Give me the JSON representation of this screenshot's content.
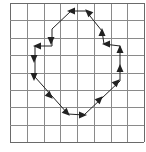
{
  "diagram": {
    "type": "chain-code-contour-on-grid",
    "grid": {
      "cols": 8,
      "rows": 8,
      "left": 10,
      "top": 3,
      "right": 144,
      "bottom": 142,
      "line_color": "#8a8a8a",
      "border_color": "#6a6a6a"
    },
    "contour": {
      "stroke_color": "#222222",
      "closed": true,
      "points": [
        [
          86,
          11
        ],
        [
          71,
          11
        ],
        [
          52,
          29
        ],
        [
          52,
          46
        ],
        [
          35,
          46
        ],
        [
          35,
          77
        ],
        [
          68,
          114
        ],
        [
          84,
          115
        ],
        [
          120,
          81
        ],
        [
          120,
          46
        ],
        [
          104,
          44
        ],
        [
          102,
          31
        ],
        [
          86,
          11
        ]
      ]
    },
    "arrows": [
      {
        "x": 71,
        "y": 11,
        "dir": "left"
      },
      {
        "x": 88,
        "y": 12,
        "dir": "up-left"
      },
      {
        "x": 51,
        "y": 41,
        "dir": "down"
      },
      {
        "x": 37,
        "y": 46,
        "dir": "left"
      },
      {
        "x": 34,
        "y": 59,
        "dir": "down"
      },
      {
        "x": 34,
        "y": 77,
        "dir": "down"
      },
      {
        "x": 50,
        "y": 96,
        "dir": "down-right"
      },
      {
        "x": 67,
        "y": 113,
        "dir": "down-right"
      },
      {
        "x": 83,
        "y": 115,
        "dir": "right"
      },
      {
        "x": 100,
        "y": 99,
        "dir": "up-right"
      },
      {
        "x": 117,
        "y": 82,
        "dir": "up-right"
      },
      {
        "x": 120,
        "y": 68,
        "dir": "up"
      },
      {
        "x": 120,
        "y": 49,
        "dir": "up"
      },
      {
        "x": 106,
        "y": 44,
        "dir": "left"
      },
      {
        "x": 102,
        "y": 32,
        "dir": "up"
      }
    ]
  }
}
